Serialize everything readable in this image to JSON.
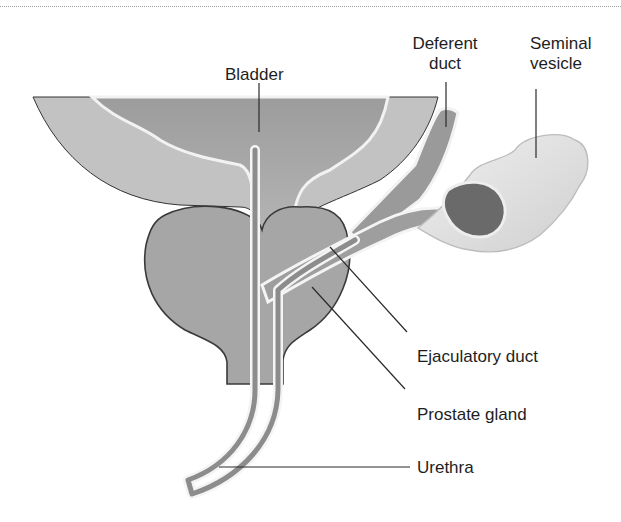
{
  "figure": {
    "type": "anatomical-diagram",
    "colors": {
      "tissue": "#a8a8a8",
      "tissue_dark": "#6e6e6e",
      "wall_light": "#c4c4c4",
      "lumen": "#8e8e8e",
      "highlight": "#f4f4f4",
      "outline": "#2a2a2a",
      "vesicle": "#e2e2e2",
      "vesicle_core": "#666666"
    }
  },
  "labels": {
    "bladder": "Bladder",
    "deferent_duct_line1": "Deferent",
    "deferent_duct_line2": "duct",
    "seminal_vesicle_line1": "Seminal",
    "seminal_vesicle_line2": "vesicle",
    "ejaculatory_duct": "Ejaculatory duct",
    "prostate_gland": "Prostate gland",
    "urethra": "Urethra"
  }
}
